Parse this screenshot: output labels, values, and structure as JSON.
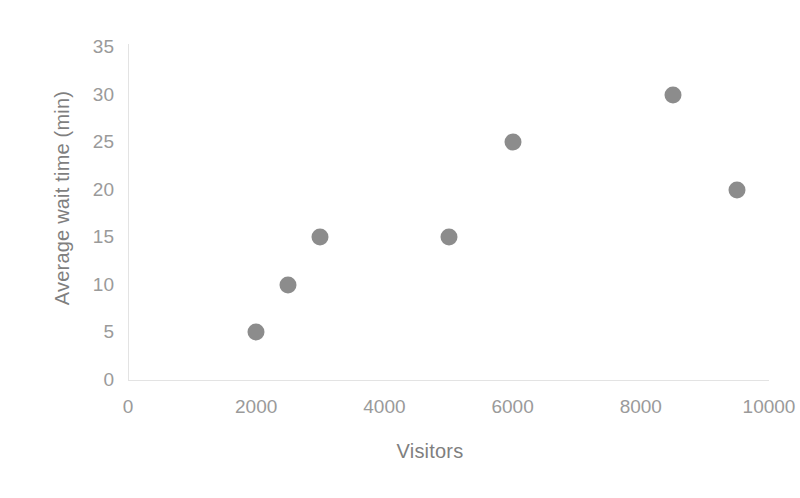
{
  "chart_data": {
    "type": "scatter",
    "title": "",
    "xlabel": "Visitors",
    "ylabel": "Average wait time (min)",
    "xlim": [
      0,
      10000
    ],
    "ylim": [
      0,
      35
    ],
    "xticks": [
      "0",
      "2000",
      "4000",
      "6000",
      "8000",
      "10000"
    ],
    "xtick_values": [
      0,
      2000,
      4000,
      6000,
      8000,
      10000
    ],
    "yticks": [
      "0",
      "5",
      "10",
      "15",
      "20",
      "25",
      "30",
      "35"
    ],
    "ytick_values": [
      0,
      5,
      10,
      15,
      20,
      25,
      30,
      35
    ],
    "grid": false,
    "legend": null,
    "marker_color": "#8c8c8c",
    "axis_color": "#e3e3e3",
    "label_color": "#7f7f7f",
    "tick_color": "#9a9a9a",
    "series": [
      {
        "name": "Wait time vs visitors",
        "points": [
          {
            "x": 2000,
            "y": 5
          },
          {
            "x": 2500,
            "y": 10
          },
          {
            "x": 3000,
            "y": 15
          },
          {
            "x": 5000,
            "y": 15
          },
          {
            "x": 6000,
            "y": 25
          },
          {
            "x": 8500,
            "y": 30
          },
          {
            "x": 9500,
            "y": 20
          }
        ]
      }
    ]
  }
}
